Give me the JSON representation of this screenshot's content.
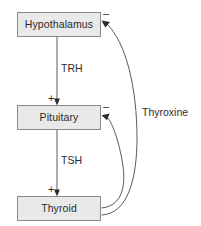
{
  "diagram": {
    "nodes": [
      {
        "id": "hypothalamus",
        "label": "Hypothalamus",
        "x": 17,
        "y": 12,
        "w": 84,
        "h": 25
      },
      {
        "id": "pituitary",
        "label": "Pituitary",
        "x": 17,
        "y": 105,
        "w": 84,
        "h": 25
      },
      {
        "id": "thyroid",
        "label": "Thyroid",
        "x": 17,
        "y": 196,
        "w": 84,
        "h": 25
      }
    ],
    "edges": [
      {
        "id": "trh",
        "label": "TRH",
        "from": "hypothalamus",
        "to": "pituitary",
        "sign": "+",
        "kind": "stimulatory",
        "shape": "straight"
      },
      {
        "id": "tsh",
        "label": "TSH",
        "from": "pituitary",
        "to": "thyroid",
        "sign": "+",
        "kind": "stimulatory",
        "shape": "straight"
      },
      {
        "id": "thyroxine-short-feedback",
        "label": "",
        "from": "thyroid",
        "to": "pituitary",
        "sign": "−",
        "kind": "inhibitory",
        "shape": "curve"
      },
      {
        "id": "thyroxine-long-feedback",
        "label": "Thyroxine",
        "from": "thyroid",
        "to": "hypothalamus",
        "sign": "−",
        "kind": "inhibitory",
        "shape": "curve"
      }
    ],
    "labels": {
      "trh": "TRH",
      "tsh": "TSH",
      "thyroxine": "Thyroxine",
      "plus_to_pituitary": "+",
      "plus_to_thyroid": "+",
      "minus_at_hypothalamus": "–",
      "minus_at_pituitary": "–"
    },
    "colors": {
      "node_fill": "#e9e9e9",
      "node_border": "#8a8a8a",
      "line": "#5a5a5a",
      "arrowhead": "#2b2b2b",
      "text": "#2b2b2b",
      "background": "#ffffff"
    }
  }
}
